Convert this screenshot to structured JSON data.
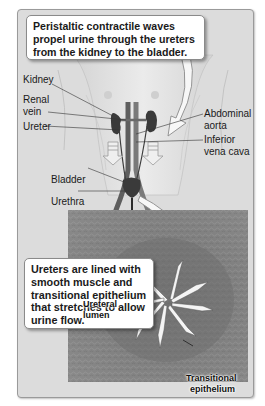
{
  "figure": {
    "type": "anatomical-illustration",
    "colors": {
      "panel_background": "#dcdcdc",
      "organ_dark": "#3a3a3a",
      "vessel": "#5e5e5e",
      "micrograph_tissue": "#7a7a7a",
      "lumen": "#f4f4f4"
    }
  },
  "callouts": {
    "top": "Peristaltic contractile waves propel urine through the ureters from the kidney to the bladder.",
    "bottom": "Ureters are lined with smooth muscle and transitional epithelium that stretches to allow urine flow."
  },
  "labels": {
    "kidney": "Kidney",
    "renal_vein_1": "Renal",
    "renal_vein_2": "vein",
    "ureter": "Ureter",
    "abdominal_aorta_1": "Abdominal",
    "abdominal_aorta_2": "aorta",
    "inferior_vena_cava_1": "Inferior",
    "inferior_vena_cava_2": "vena cava",
    "bladder": "Bladder",
    "urethra": "Urethra"
  },
  "micrograph": {
    "ureteral_lumen_1": "Ureteral",
    "ureteral_lumen_2": "lumen",
    "transitional_epithelium_1": "Transitional",
    "transitional_epithelium_2": "epithelium"
  }
}
